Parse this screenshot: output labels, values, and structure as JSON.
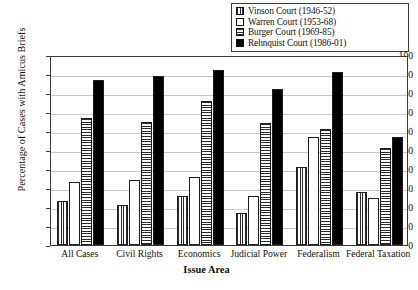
{
  "chart_data": {
    "type": "bar",
    "title": "",
    "xlabel": "Issue Area",
    "ylabel": "Percentage of Cases with Amicus Briefs",
    "ylim": [
      0,
      100
    ],
    "ytick_step": 10,
    "yticks": [
      0,
      10,
      20,
      30,
      40,
      50,
      60,
      70,
      80,
      90,
      100
    ],
    "grid": "horizontal",
    "legend_position": "top-right",
    "categories": [
      "All Cases",
      "Civil Rights",
      "Economics",
      "Judicial Power",
      "Federalism",
      "Federal Taxation"
    ],
    "series": [
      {
        "name": "Vinson Court (1946-52)",
        "pattern": "vertical-stripes",
        "color": "#2b2b2b",
        "values": [
          23,
          21,
          26,
          17,
          41,
          28
        ]
      },
      {
        "name": "Warren Court (1953-68)",
        "pattern": "white-empty",
        "color": "#ffffff",
        "values": [
          33,
          34,
          36,
          26,
          57,
          25
        ]
      },
      {
        "name": "Burger Court (1969-85)",
        "pattern": "horizontal-stripes",
        "color": "#2b2b2b",
        "values": [
          67,
          65,
          76,
          64,
          61,
          51
        ]
      },
      {
        "name": "Rehnquist Court (1986-01)",
        "pattern": "solid-black",
        "color": "#000000",
        "values": [
          87,
          89,
          92,
          82,
          91,
          57
        ]
      }
    ]
  },
  "legend": {
    "items": [
      {
        "label": "Vinson Court (1946-52)",
        "pattern": "vertical-stripes"
      },
      {
        "label": "Warren Court (1953-68)",
        "pattern": "white-empty"
      },
      {
        "label": "Burger Court (1969-85)",
        "pattern": "horizontal-stripes"
      },
      {
        "label": "Rehnquist Court (1986-01)",
        "pattern": "solid-black"
      }
    ]
  }
}
